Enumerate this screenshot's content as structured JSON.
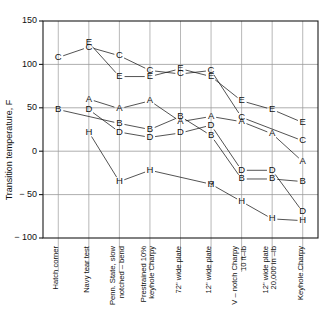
{
  "chart_data": {
    "type": "line",
    "title": "",
    "xlabel": "",
    "ylabel": "Transition temperature, F",
    "ylim": [
      -100,
      150
    ],
    "yticks": [
      150,
      100,
      50,
      0,
      -50,
      -100
    ],
    "ytick_labels": [
      "150",
      "100",
      "50",
      "0",
      "− 50",
      "− 100"
    ],
    "grid": true,
    "legend": "none",
    "point_markers": "letter-coded (A–E, H) steel identification",
    "categories": [
      "Hatch corner",
      "Navy tear test",
      "Penn. State, slow notched – bend",
      "Prestrained 10% keyhole Charpy",
      "72\" wide plate",
      "12\" wide plate",
      "V – notch Charpy 10 ft–lb",
      "12\" wide plate 20,000 in –lb",
      "Keyhole Charpy"
    ],
    "category_lines": [
      [
        "Hatch corner"
      ],
      [
        "Navy tear test"
      ],
      [
        "Penn. State, slow",
        "notched – bend"
      ],
      [
        "Prestrained 10%",
        "keyhole Charpy"
      ],
      [
        "72\" wide plate"
      ],
      [
        "12\" wide plate"
      ],
      [
        "V – notch Charpy",
        "10 ft–lb"
      ],
      [
        "12\" wide plate",
        "20,000 in –lb"
      ],
      [
        "Keyhole Charpy"
      ]
    ],
    "series": [
      {
        "name": "A",
        "values": [
          null,
          60,
          49,
          58,
          34,
          40,
          34,
          20,
          -12
        ]
      },
      {
        "name": "B",
        "values": [
          48,
          null,
          32,
          25,
          40,
          18,
          -32,
          -32,
          -35
        ]
      },
      {
        "name": "C",
        "values": [
          108,
          120,
          110,
          93,
          89,
          93,
          39,
          null,
          12
        ]
      },
      {
        "name": "D",
        "values": [
          null,
          48,
          22,
          16,
          21,
          30,
          -22,
          -22,
          -70
        ]
      },
      {
        "name": "E",
        "values": [
          null,
          125,
          86,
          86,
          95,
          86,
          58,
          48,
          33
        ]
      },
      {
        "name": "H",
        "values": [
          null,
          22,
          -35,
          -22,
          null,
          -38,
          -58,
          -78,
          -80
        ]
      }
    ],
    "annotations": [
      {
        "text": "?",
        "category": "12\" wide plate",
        "value": -38,
        "note": "uncertain H point"
      }
    ]
  }
}
